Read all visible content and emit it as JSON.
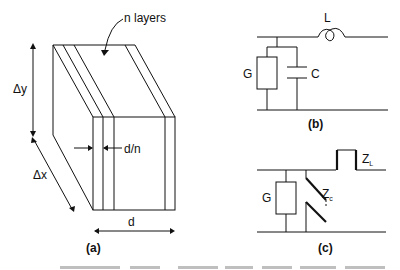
{
  "figure": {
    "panels": [
      {
        "id": "a",
        "caption": "(a)",
        "description": "Layered slab of n layers, thickness d, each layer thickness d/n, with dimensions Δx and Δy",
        "labels": {
          "layers": "n layers",
          "height": "Δy",
          "depth": "Δx",
          "layer_thickness": "d/n",
          "thickness": "d"
        }
      },
      {
        "id": "b",
        "caption": "(b)",
        "description": "Lumped equivalent circuit: series inductor L, shunt conductance G in parallel with capacitance C",
        "labels": {
          "inductor": "L",
          "conductance": "G",
          "capacitance": "C"
        }
      },
      {
        "id": "c",
        "caption": "(c)",
        "description": "Transmission-line equivalent: shunt G and line impedance Zc, series line section ZL",
        "labels": {
          "conductance": "G",
          "shunt_line": "Z",
          "shunt_line_sub": "c",
          "series_line": "Z",
          "series_line_sub": "L"
        }
      }
    ]
  },
  "colors": {
    "line": "#111111",
    "background": "#ffffff"
  }
}
